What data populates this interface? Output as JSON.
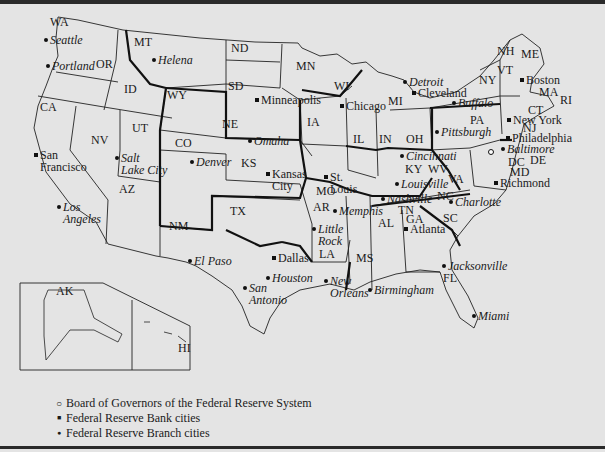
{
  "map": {
    "title": "Federal Reserve System",
    "states": [
      {
        "abbr": "WA",
        "x": 50,
        "y": 26
      },
      {
        "abbr": "OR",
        "x": 96,
        "y": 68
      },
      {
        "abbr": "ID",
        "x": 124,
        "y": 93
      },
      {
        "abbr": "MT",
        "x": 134,
        "y": 46
      },
      {
        "abbr": "ND",
        "x": 231,
        "y": 52
      },
      {
        "abbr": "SD",
        "x": 228,
        "y": 90
      },
      {
        "abbr": "MN",
        "x": 296,
        "y": 70
      },
      {
        "abbr": "WI",
        "x": 334,
        "y": 90
      },
      {
        "abbr": "MI",
        "x": 388,
        "y": 105
      },
      {
        "abbr": "WY",
        "x": 167,
        "y": 99
      },
      {
        "abbr": "NE",
        "x": 222,
        "y": 128
      },
      {
        "abbr": "IA",
        "x": 307,
        "y": 126
      },
      {
        "abbr": "IL",
        "x": 353,
        "y": 143
      },
      {
        "abbr": "IN",
        "x": 379,
        "y": 143
      },
      {
        "abbr": "OH",
        "x": 406,
        "y": 143
      },
      {
        "abbr": "CA",
        "x": 40,
        "y": 111
      },
      {
        "abbr": "NV",
        "x": 91,
        "y": 144
      },
      {
        "abbr": "UT",
        "x": 132,
        "y": 132
      },
      {
        "abbr": "CO",
        "x": 175,
        "y": 147
      },
      {
        "abbr": "KS",
        "x": 241,
        "y": 167
      },
      {
        "abbr": "MO",
        "x": 316,
        "y": 195
      },
      {
        "abbr": "AZ",
        "x": 119,
        "y": 193
      },
      {
        "abbr": "NM",
        "x": 169,
        "y": 230
      },
      {
        "abbr": "TX",
        "x": 230,
        "y": 215
      },
      {
        "abbr": "AR",
        "x": 313,
        "y": 211
      },
      {
        "abbr": "LA",
        "x": 319,
        "y": 258
      },
      {
        "abbr": "MS",
        "x": 356,
        "y": 262
      },
      {
        "abbr": "AL",
        "x": 378,
        "y": 227
      },
      {
        "abbr": "TN",
        "x": 398,
        "y": 214
      },
      {
        "abbr": "KY",
        "x": 405,
        "y": 173
      },
      {
        "abbr": "WV",
        "x": 428,
        "y": 173
      },
      {
        "abbr": "VA",
        "x": 448,
        "y": 183
      },
      {
        "abbr": "NC",
        "x": 437,
        "y": 200
      },
      {
        "abbr": "SC",
        "x": 443,
        "y": 222
      },
      {
        "abbr": "GA",
        "x": 406,
        "y": 223
      },
      {
        "abbr": "FL",
        "x": 443,
        "y": 282
      },
      {
        "abbr": "PA",
        "x": 470,
        "y": 124
      },
      {
        "abbr": "NY",
        "x": 479,
        "y": 84
      },
      {
        "abbr": "VT",
        "x": 497,
        "y": 74
      },
      {
        "abbr": "NH",
        "x": 497,
        "y": 55
      },
      {
        "abbr": "ME",
        "x": 521,
        "y": 58
      },
      {
        "abbr": "MA",
        "x": 539,
        "y": 96
      },
      {
        "abbr": "RI",
        "x": 560,
        "y": 104
      },
      {
        "abbr": "CT",
        "x": 528,
        "y": 114
      },
      {
        "abbr": "NJ",
        "x": 523,
        "y": 132
      },
      {
        "abbr": "DE",
        "x": 530,
        "y": 164
      },
      {
        "abbr": "DC",
        "x": 508,
        "y": 166
      },
      {
        "abbr": "MD",
        "x": 510,
        "y": 176
      },
      {
        "abbr": "AK",
        "x": 56,
        "y": 295
      },
      {
        "abbr": "HI",
        "x": 178,
        "y": 352
      }
    ],
    "cities": [
      {
        "name": "Seattle",
        "x": 50,
        "y": 42,
        "type": "branch",
        "lines": [
          "Seattle"
        ]
      },
      {
        "name": "Portland",
        "x": 52,
        "y": 68,
        "type": "branch",
        "lines": [
          "Portland"
        ]
      },
      {
        "name": "Helena",
        "x": 158,
        "y": 62,
        "type": "branch",
        "lines": [
          "Helena"
        ]
      },
      {
        "name": "Minneapolis",
        "x": 261,
        "y": 102,
        "type": "bank",
        "lines": [
          "Minneapolis"
        ]
      },
      {
        "name": "Salt Lake City",
        "x": 121,
        "y": 160,
        "type": "branch",
        "lines": [
          "Salt",
          "Lake City"
        ]
      },
      {
        "name": "San Francisco",
        "x": 40,
        "y": 157,
        "type": "bank",
        "lines": [
          "San",
          "Francisco"
        ]
      },
      {
        "name": "Denver",
        "x": 196,
        "y": 164,
        "type": "branch",
        "lines": [
          "Denver"
        ]
      },
      {
        "name": "Omaha",
        "x": 254,
        "y": 143,
        "type": "branch",
        "lines": [
          "Omaha"
        ]
      },
      {
        "name": "Kansas City",
        "x": 272,
        "y": 176,
        "type": "bank",
        "lines": [
          "Kansas",
          "City"
        ]
      },
      {
        "name": "Chicago",
        "x": 346,
        "y": 108,
        "type": "bank",
        "lines": [
          "Chicago"
        ]
      },
      {
        "name": "Detroit",
        "x": 409,
        "y": 84,
        "type": "branch",
        "lines": [
          "Detroit"
        ]
      },
      {
        "name": "Cleveland",
        "x": 418,
        "y": 95,
        "type": "bank",
        "lines": [
          "Cleveland"
        ]
      },
      {
        "name": "Buffalo",
        "x": 458,
        "y": 105,
        "type": "branch",
        "lines": [
          "Buffalo"
        ]
      },
      {
        "name": "Pittsburgh",
        "x": 441,
        "y": 134,
        "type": "branch",
        "lines": [
          "Pittsburgh"
        ]
      },
      {
        "name": "Boston",
        "x": 526,
        "y": 82,
        "type": "bank",
        "lines": [
          "Boston"
        ]
      },
      {
        "name": "New York",
        "x": 513,
        "y": 122,
        "type": "bank",
        "lines": [
          "New York"
        ]
      },
      {
        "name": "Philadelphia",
        "x": 512,
        "y": 140,
        "type": "bank",
        "lines": [
          "Philadelphia"
        ]
      },
      {
        "name": "Baltimore",
        "x": 507,
        "y": 151,
        "type": "branch",
        "lines": [
          "Baltimore"
        ]
      },
      {
        "name": "Richmond",
        "x": 500,
        "y": 185,
        "type": "bank",
        "lines": [
          "Richmond"
        ]
      },
      {
        "name": "Cincinnati",
        "x": 406,
        "y": 158,
        "type": "branch",
        "lines": [
          "Cincinnati"
        ]
      },
      {
        "name": "Louisville",
        "x": 401,
        "y": 186,
        "type": "branch",
        "lines": [
          "Louisville"
        ]
      },
      {
        "name": "St. Louis",
        "x": 330,
        "y": 179,
        "type": "bank",
        "lines": [
          "St.",
          "Louis"
        ]
      },
      {
        "name": "Nashville",
        "x": 387,
        "y": 201,
        "type": "branch",
        "lines": [
          "Nashville"
        ]
      },
      {
        "name": "Memphis",
        "x": 339,
        "y": 213,
        "type": "branch",
        "lines": [
          "Memphis"
        ]
      },
      {
        "name": "Charlotte",
        "x": 455,
        "y": 204,
        "type": "branch",
        "lines": [
          "Charlotte"
        ]
      },
      {
        "name": "Little Rock",
        "x": 318,
        "y": 231,
        "type": "branch",
        "lines": [
          "Little",
          "Rock"
        ]
      },
      {
        "name": "Atlanta",
        "x": 410,
        "y": 231,
        "type": "bank",
        "lines": [
          "Atlanta"
        ]
      },
      {
        "name": "Dallas",
        "x": 278,
        "y": 260,
        "type": "bank",
        "lines": [
          "Dallas"
        ]
      },
      {
        "name": "El Paso",
        "x": 194,
        "y": 263,
        "type": "branch",
        "lines": [
          "El Paso"
        ]
      },
      {
        "name": "Houston",
        "x": 272,
        "y": 280,
        "type": "branch",
        "lines": [
          "Houston"
        ]
      },
      {
        "name": "San Antonio",
        "x": 249,
        "y": 290,
        "type": "branch",
        "lines": [
          "San",
          "Antonio"
        ]
      },
      {
        "name": "New Orleans",
        "x": 330,
        "y": 283,
        "type": "branch",
        "lines": [
          "New",
          "Orleans"
        ]
      },
      {
        "name": "Birmingham",
        "x": 374,
        "y": 292,
        "type": "branch",
        "lines": [
          "Birmingham"
        ]
      },
      {
        "name": "Jacksonville",
        "x": 448,
        "y": 268,
        "type": "branch",
        "lines": [
          "Jacksonville"
        ]
      },
      {
        "name": "Miami",
        "x": 478,
        "y": 318,
        "type": "branch",
        "lines": [
          "Miami"
        ]
      },
      {
        "name": "Los Angeles",
        "x": 63,
        "y": 209,
        "type": "branch",
        "lines": [
          "Los",
          "Angeles"
        ]
      }
    ],
    "board": {
      "name": "Board of Governors",
      "x": 491,
      "y": 152
    }
  },
  "legend": {
    "items": [
      {
        "symbol": "○",
        "label": "Board of Governors of the Federal Reserve System"
      },
      {
        "symbol": "■",
        "label": "Federal Reserve Bank cities"
      },
      {
        "symbol": "●",
        "label": "Federal Reserve Branch cities"
      }
    ]
  },
  "colors": {
    "background": "#e4e4e4",
    "ink": "#1a1a1a",
    "rule": "#2a2a2a"
  }
}
